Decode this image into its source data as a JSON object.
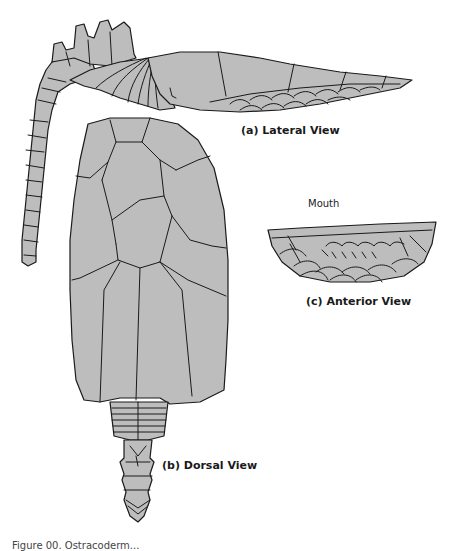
{
  "colors": {
    "fill": "#bdbdbd",
    "stroke": "#1a1a1a",
    "background": "#ffffff"
  },
  "labels": {
    "lateral": "(a) Lateral View",
    "dorsal": "(b) Dorsal View",
    "anterior": "(c) Anterior View",
    "mouth": "Mouth"
  },
  "caption": "Figure 00. Ostracoderm..."
}
